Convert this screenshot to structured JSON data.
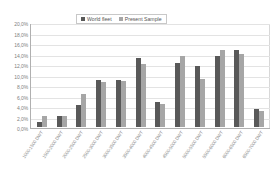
{
  "chart_data": {
    "type": "bar",
    "title": "",
    "xlabel": "",
    "ylabel": "",
    "ylim": [
      0,
      20
    ],
    "grid": true,
    "legend_position": "top-center",
    "categories": [
      "1000-1500 DWT",
      "1500-2000 DWT",
      "2000-2500 DWT",
      "2500-3000 DWT",
      "3000-3500 DWT",
      "3500-4000 DWT",
      "4000-4500 DWT",
      "4500-5000 DWT",
      "5000-5500 DWT",
      "5500-6000 DWT",
      "6000-6500 DWT",
      "6500-7000 DWT"
    ],
    "ytick_labels": [
      "0,0%",
      "2,0%",
      "4,0%",
      "6,0%",
      "8,0%",
      "10,0%",
      "12,0%",
      "14,0%",
      "16,0%",
      "18,0%",
      "20,0%"
    ],
    "ytick_values": [
      0,
      2,
      4,
      6,
      8,
      10,
      12,
      14,
      16,
      18,
      20
    ],
    "series": [
      {
        "name": "World fleet",
        "color": "#595959",
        "values": [
          1.0,
          2.1,
          4.2,
          9.0,
          9.0,
          13.2,
          4.7,
          12.2,
          11.6,
          13.5,
          14.6,
          3.5
        ]
      },
      {
        "name": "Present Sample",
        "color": "#a6a6a6",
        "values": [
          2.1,
          2.1,
          6.2,
          8.6,
          8.8,
          12.0,
          4.4,
          13.5,
          9.2,
          14.6,
          14.0,
          3.0
        ]
      }
    ]
  }
}
